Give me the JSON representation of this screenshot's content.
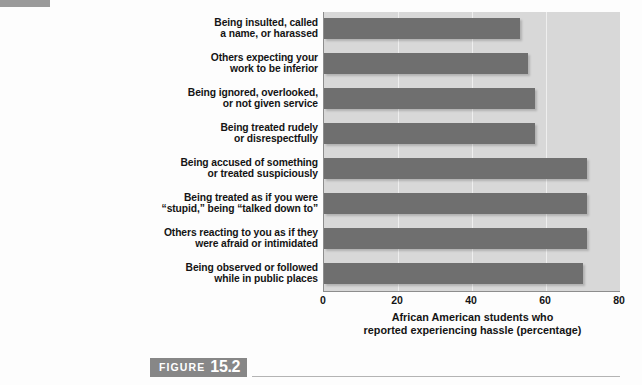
{
  "figure": {
    "word": "FIGURE",
    "number": "15.2"
  },
  "colors": {
    "bar": "#6f6f6f",
    "plot_background": "#d8d8d8",
    "gridline": "#efefef",
    "axis": "#8d8d8d",
    "caption_box": "#878787",
    "corner_marker": "#9a9a9a"
  },
  "chart_data": {
    "type": "bar",
    "orientation": "horizontal",
    "title": "",
    "subtitle": "",
    "xlabel_lines": [
      "African American students who",
      "reported experiencing hassle (percentage)"
    ],
    "xlabel": "African American students who reported experiencing hassle (percentage)",
    "ylabel": "",
    "xlim": [
      0,
      80
    ],
    "xticks": [
      "0",
      "20",
      "40",
      "60",
      "80"
    ],
    "xtick_values": [
      0,
      20,
      40,
      60,
      80
    ],
    "grid": true,
    "grid_axis": "x",
    "legend": false,
    "legend_position": "none",
    "categories": [
      "Being insulted, called a name, or harassed",
      "Others expecting your work to be inferior",
      "Being ignored, overlooked, or not given service",
      "Being treated rudely or disrespectfully",
      "Being accused of something or treated suspiciously",
      "Being treated as if you were “stupid,” being “talked down to”",
      "Others reacting to you as if they were afraid or intimidated",
      "Being observed or followed while in public places"
    ],
    "category_lines": [
      [
        "Being insulted, called",
        "a name, or harassed"
      ],
      [
        "Others expecting your",
        "work to be inferior"
      ],
      [
        "Being ignored, overlooked,",
        "or not given service"
      ],
      [
        "Being treated rudely",
        "or disrespectfully"
      ],
      [
        "Being accused of something",
        "or treated suspiciously"
      ],
      [
        "Being treated as if you were",
        "“stupid,” being “talked down to”"
      ],
      [
        "Others reacting to you as if they",
        "were afraid or intimidated"
      ],
      [
        "Being observed or followed",
        "while in public places"
      ]
    ],
    "values": [
      53,
      55,
      57,
      57,
      71,
      71,
      71,
      70
    ]
  }
}
